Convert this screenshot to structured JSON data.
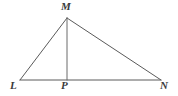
{
  "figure": {
    "kind": "triangle-with-altitude",
    "background_color": "#ffffff",
    "stroke_color": "#5a5a5a",
    "label_color": "#3a3a3a",
    "stroke_width": 1,
    "labels": {
      "apex": "M",
      "left_base": "L",
      "foot": "P",
      "right_base": "N"
    },
    "points": {
      "M": {
        "x": 67,
        "y": 18
      },
      "L": {
        "x": 20,
        "y": 80
      },
      "P": {
        "x": 67,
        "y": 80
      },
      "N": {
        "x": 161,
        "y": 80
      }
    },
    "segments": [
      {
        "name": "LM",
        "from": "L",
        "to": "M"
      },
      {
        "name": "MN",
        "from": "M",
        "to": "N"
      },
      {
        "name": "LN",
        "from": "L",
        "to": "N"
      },
      {
        "name": "MP",
        "from": "M",
        "to": "P"
      }
    ]
  }
}
